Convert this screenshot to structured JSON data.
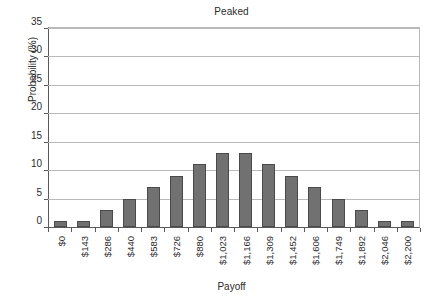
{
  "chart_data": {
    "type": "bar",
    "title": "Peaked",
    "xlabel": "Payoff",
    "ylabel": "Probability (%)",
    "categories": [
      "$0",
      "$143",
      "$286",
      "$440",
      "$583",
      "$726",
      "$880",
      "$1,023",
      "$1,166",
      "$1,309",
      "$1,452",
      "$1,606",
      "$1,749",
      "$1,892",
      "$2,046",
      "$2,200"
    ],
    "values": [
      1,
      1,
      3,
      5,
      7,
      9,
      11,
      13,
      13,
      11,
      9,
      7,
      5,
      3,
      1,
      1
    ],
    "ylim": [
      0,
      35
    ],
    "yticks": [
      0,
      5,
      10,
      15,
      20,
      25,
      30,
      35
    ],
    "ytick_labels": [
      "0",
      "5",
      "10",
      "15",
      "20",
      "25",
      "30",
      "35"
    ],
    "grid": true,
    "legend": false,
    "bar_color": "#717171",
    "bar_edge_color": "#4a4a4a",
    "gridline_color": "#b9b9b9",
    "axis_color": "#5a5a5a"
  }
}
